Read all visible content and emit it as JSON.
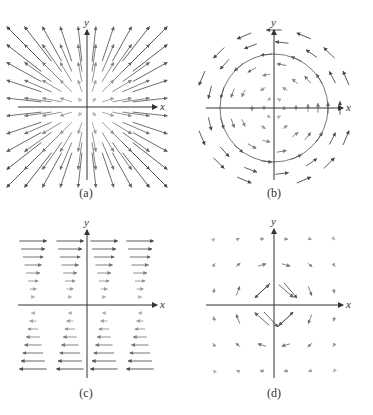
{
  "figure": {
    "panels": [
      {
        "id": "a",
        "caption": "(a)",
        "x_label": "x",
        "y_label": "y",
        "field": "radial-outward",
        "description": "Arrows point radially away from the origin; length grows with distance"
      },
      {
        "id": "b",
        "caption": "(b)",
        "x_label": "x",
        "y_label": "y",
        "field": "rotational-counterclockwise",
        "description": "Arrows circulate counter-clockwise around the origin with a circle through the field"
      },
      {
        "id": "c",
        "caption": "(c)",
        "x_label": "x",
        "y_label": "y",
        "field": "horizontal-shear",
        "description": "Horizontal arrows pointing right above the x-axis and left below it; length grows with |y|"
      },
      {
        "id": "d",
        "caption": "(d)",
        "x_label": "x",
        "y_label": "y",
        "field": "decaying",
        "description": "Arrows largest near origin and nearly vanish farther away"
      }
    ]
  },
  "colors": {
    "axis": "#333333",
    "arrow_dark": "#444444",
    "arrow_light": "#aaaaaa"
  }
}
